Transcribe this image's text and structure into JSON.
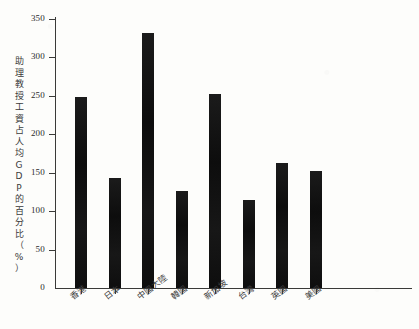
{
  "chart_data": {
    "type": "bar",
    "title": "",
    "xlabel": "",
    "ylabel": "助理教授工資占人均GDP的百分比（%）",
    "categories": [
      "香港",
      "日本",
      "中國大陸",
      "韓國",
      "新加坡",
      "台灣",
      "英國",
      "美國"
    ],
    "values": [
      248,
      143,
      332,
      126,
      253,
      115,
      163,
      152
    ],
    "ylim": [
      0,
      350
    ],
    "yticks": [
      0,
      50,
      100,
      150,
      200,
      250,
      300,
      350
    ],
    "ytick_labels": [
      "0",
      "50",
      "100",
      "150",
      "200",
      "250",
      "300",
      "350"
    ],
    "grid": false,
    "legend": null,
    "bar_color": "#141414",
    "axis_color": "#3a3a38",
    "background_color": "#fdfdfb"
  },
  "axis": {
    "y_title_chars": [
      "助",
      "理",
      "教",
      "授",
      "工",
      "資",
      "占",
      "人",
      "均",
      "G",
      "D",
      "P",
      "的",
      "百",
      "分",
      "比",
      "（",
      "%",
      "）"
    ]
  }
}
